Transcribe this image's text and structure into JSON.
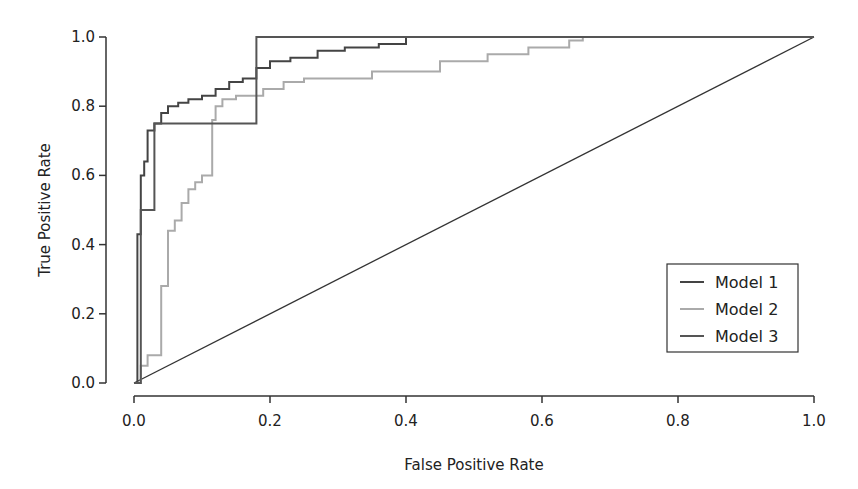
{
  "chart_data": {
    "type": "line",
    "title": "",
    "xlabel": "False Positive Rate",
    "ylabel": "True Positive Rate",
    "xlim": [
      0,
      1
    ],
    "ylim": [
      0,
      1
    ],
    "xticks": [
      0.0,
      0.2,
      0.4,
      0.6,
      0.8,
      1.0
    ],
    "xtick_labels": [
      "0.0",
      "0.2",
      "0.4",
      "0.6",
      "0.8",
      "1.0"
    ],
    "yticks": [
      0.0,
      0.2,
      0.4,
      0.6,
      0.8,
      1.0
    ],
    "ytick_labels": [
      "0.0",
      "0.2",
      "0.4",
      "0.6",
      "0.8",
      "1.0"
    ],
    "grid": false,
    "legend_position": "bottom-right",
    "reference_line": {
      "name": "chance",
      "x": [
        0,
        1
      ],
      "y": [
        0,
        1
      ],
      "color": "#333333"
    },
    "series": [
      {
        "name": "Model 1",
        "color": "#444444",
        "x": [
          0,
          0.005,
          0.005,
          0.01,
          0.01,
          0.015,
          0.015,
          0.02,
          0.02,
          0.03,
          0.03,
          0.04,
          0.04,
          0.05,
          0.05,
          0.065,
          0.065,
          0.08,
          0.08,
          0.1,
          0.1,
          0.12,
          0.12,
          0.14,
          0.14,
          0.16,
          0.16,
          0.18,
          0.18,
          0.2,
          0.2,
          0.23,
          0.23,
          0.27,
          0.27,
          0.31,
          0.31,
          0.36,
          0.36,
          0.4,
          0.4,
          0.58
        ],
        "y": [
          0,
          0,
          0.43,
          0.43,
          0.6,
          0.6,
          0.64,
          0.64,
          0.73,
          0.73,
          0.75,
          0.75,
          0.78,
          0.78,
          0.8,
          0.8,
          0.81,
          0.81,
          0.82,
          0.82,
          0.83,
          0.83,
          0.85,
          0.85,
          0.87,
          0.87,
          0.88,
          0.88,
          0.91,
          0.91,
          0.93,
          0.93,
          0.94,
          0.94,
          0.96,
          0.96,
          0.97,
          0.97,
          0.98,
          0.98,
          1.0,
          1.0
        ]
      },
      {
        "name": "Model 2",
        "color": "#aaaaaa",
        "x": [
          0,
          0.01,
          0.01,
          0.02,
          0.02,
          0.04,
          0.04,
          0.05,
          0.05,
          0.06,
          0.06,
          0.07,
          0.07,
          0.08,
          0.08,
          0.09,
          0.09,
          0.1,
          0.1,
          0.115,
          0.115,
          0.12,
          0.12,
          0.13,
          0.13,
          0.15,
          0.15,
          0.19,
          0.19,
          0.22,
          0.22,
          0.25,
          0.25,
          0.35,
          0.35,
          0.45,
          0.45,
          0.52,
          0.52,
          0.58,
          0.58,
          0.64,
          0.64,
          0.66,
          0.66,
          1.0
        ],
        "y": [
          0,
          0,
          0.05,
          0.05,
          0.08,
          0.08,
          0.28,
          0.28,
          0.44,
          0.44,
          0.47,
          0.47,
          0.52,
          0.52,
          0.56,
          0.56,
          0.58,
          0.58,
          0.6,
          0.6,
          0.76,
          0.76,
          0.8,
          0.8,
          0.82,
          0.82,
          0.83,
          0.83,
          0.85,
          0.85,
          0.87,
          0.87,
          0.88,
          0.88,
          0.9,
          0.9,
          0.93,
          0.93,
          0.95,
          0.95,
          0.97,
          0.97,
          0.99,
          0.99,
          1.0,
          1.0
        ]
      },
      {
        "name": "Model 3",
        "color": "#555555",
        "x": [
          0,
          0.01,
          0.01,
          0.03,
          0.03,
          0.18,
          0.18,
          1.0
        ],
        "y": [
          0,
          0,
          0.5,
          0.5,
          0.75,
          0.75,
          1.0,
          1.0
        ]
      }
    ]
  }
}
